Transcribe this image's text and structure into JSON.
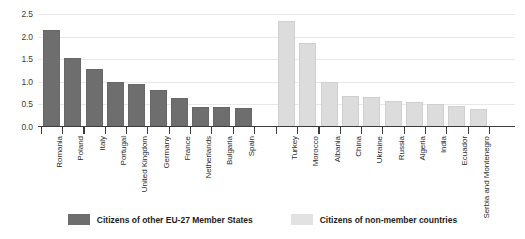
{
  "chart_data": {
    "type": "bar",
    "title": "",
    "subtitle": "",
    "xlabel": "",
    "ylabel": "",
    "ylim": [
      0.0,
      2.5
    ],
    "yticks": [
      "0.0",
      "0.5",
      "1.0",
      "1.5",
      "2.0",
      "2.5"
    ],
    "ytick_values": [
      0.0,
      0.5,
      1.0,
      1.5,
      2.0,
      2.5
    ],
    "grid": true,
    "legend_position": "bottom",
    "groups": [
      {
        "name": "Citizens of other EU-27 Member States",
        "color": "#6e6e6e",
        "categories": [
          "Romania",
          "Poland",
          "Italy",
          "Portugal",
          "United Kingdom",
          "Germany",
          "France",
          "Netherlands",
          "Bulgaria",
          "Spain"
        ],
        "values": [
          2.15,
          1.53,
          1.28,
          1.0,
          0.95,
          0.82,
          0.65,
          0.45,
          0.44,
          0.41
        ]
      },
      {
        "name": "Citizens of non-member countries",
        "color": "#dcdcdc",
        "categories": [
          "Turkey",
          "Morocco",
          "Albania",
          "China",
          "Ukraine",
          "Russia",
          "Algeria",
          "India",
          "Ecuador",
          "Serbia and Montenegro"
        ],
        "values": [
          2.35,
          1.85,
          1.0,
          0.68,
          0.67,
          0.58,
          0.55,
          0.5,
          0.47,
          0.39
        ]
      }
    ],
    "categories": [
      "Romania",
      "Poland",
      "Italy",
      "Portugal",
      "United Kingdom",
      "Germany",
      "France",
      "Netherlands",
      "Bulgaria",
      "Spain",
      "Turkey",
      "Morocco",
      "Albania",
      "China",
      "Ukraine",
      "Russia",
      "Algeria",
      "India",
      "Ecuador",
      "Serbia and Montenegro"
    ],
    "values": [
      2.15,
      1.53,
      1.28,
      1.0,
      0.95,
      0.82,
      0.65,
      0.45,
      0.44,
      0.41,
      2.35,
      1.85,
      1.0,
      0.68,
      0.67,
      0.58,
      0.55,
      0.5,
      0.47,
      0.39
    ]
  },
  "legend": {
    "items": [
      {
        "label": "Citizens of other EU-27 Member States",
        "color": "#6e6e6e"
      },
      {
        "label": "Citizens of non-member countries",
        "color": "#e2e2e2"
      }
    ]
  }
}
